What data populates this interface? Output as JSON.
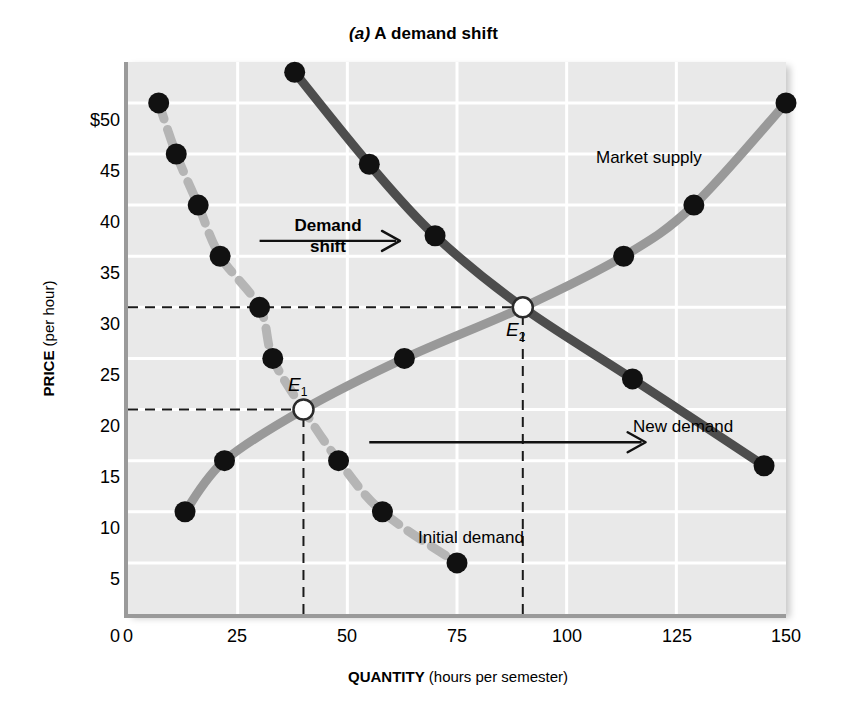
{
  "title": {
    "panel_letter": "(a)",
    "text": " A demand shift"
  },
  "axes": {
    "y_label_bold": "PRICE",
    "y_label_rest": " (per hour)",
    "x_label_bold": "QUANTITY",
    "x_label_rest": " (hours per semester)",
    "y_ticks": [
      "$50",
      "45",
      "40",
      "35",
      "30",
      "25",
      "20",
      "15",
      "10",
      "5",
      "0"
    ],
    "x_ticks": [
      "0",
      "25",
      "50",
      "75",
      "100",
      "125",
      "150"
    ]
  },
  "annotations": {
    "market_supply": "Market supply",
    "new_demand": "New demand",
    "initial_demand": "Initial demand",
    "demand_shift_line1": "Demand",
    "demand_shift_line2": "shift",
    "e1": "E",
    "e1_sub": "1",
    "e2": "E",
    "e2_sub": "2"
  },
  "colors": {
    "plot_background": "#e9e9e9",
    "gridline": "#ffffff",
    "initial_demand": "#b5b5b5",
    "market_supply": "#999999",
    "new_demand": "#4d4d4d",
    "point_fill": "#111111",
    "equilibrium_fill": "#ffffff",
    "axis": "#9a9a9a"
  },
  "chart_data": {
    "type": "line",
    "title": "(a) A demand shift",
    "xlabel": "QUANTITY (hours per semester)",
    "ylabel": "PRICE (per hour)",
    "xlim": [
      0,
      150
    ],
    "ylim": [
      0,
      54
    ],
    "grid": true,
    "legend_position": "inline-labels",
    "series": [
      {
        "name": "Initial demand",
        "style": "dashed",
        "color": "#b5b5b5",
        "points": [
          {
            "x": 7,
            "y": 50
          },
          {
            "x": 11,
            "y": 45
          },
          {
            "x": 16,
            "y": 40
          },
          {
            "x": 21,
            "y": 35
          },
          {
            "x": 30,
            "y": 30
          },
          {
            "x": 33,
            "y": 25
          },
          {
            "x": 40,
            "y": 20
          },
          {
            "x": 48,
            "y": 15
          },
          {
            "x": 58,
            "y": 10
          },
          {
            "x": 75,
            "y": 5
          }
        ]
      },
      {
        "name": "Market supply",
        "style": "solid",
        "color": "#999999",
        "points": [
          {
            "x": 13,
            "y": 10
          },
          {
            "x": 22,
            "y": 15
          },
          {
            "x": 40,
            "y": 20
          },
          {
            "x": 63,
            "y": 25
          },
          {
            "x": 90,
            "y": 30
          },
          {
            "x": 113,
            "y": 35
          },
          {
            "x": 129,
            "y": 40
          },
          {
            "x": 150,
            "y": 50
          }
        ]
      },
      {
        "name": "New demand",
        "style": "solid",
        "color": "#4d4d4d",
        "points": [
          {
            "x": 38,
            "y": 53
          },
          {
            "x": 55,
            "y": 44
          },
          {
            "x": 70,
            "y": 37
          },
          {
            "x": 90,
            "y": 30
          },
          {
            "x": 115,
            "y": 23
          },
          {
            "x": 145,
            "y": 14.5
          }
        ]
      }
    ],
    "equilibria": [
      {
        "label": "E1",
        "x": 40,
        "y": 20
      },
      {
        "label": "E2",
        "x": 90,
        "y": 30
      }
    ],
    "guide_lines": [
      {
        "type": "horizontal",
        "y": 20,
        "from_x": 0,
        "to_x": 40
      },
      {
        "type": "vertical",
        "x": 40,
        "from_y": 0,
        "to_y": 20
      },
      {
        "type": "horizontal",
        "y": 30,
        "from_x": 0,
        "to_x": 90
      },
      {
        "type": "vertical",
        "x": 90,
        "from_y": 0,
        "to_y": 30
      }
    ],
    "shift_arrows": [
      {
        "label": "Demand shift",
        "from_x": 30,
        "to_x": 62,
        "y": 36.5
      },
      {
        "label": "",
        "from_x": 55,
        "to_x": 118,
        "y": 16.8
      }
    ]
  }
}
